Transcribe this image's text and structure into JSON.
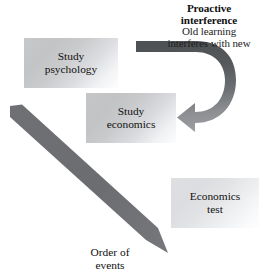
{
  "heading": {
    "title": "Proactive",
    "title2": "interference",
    "subtitle_line1": "Old learning",
    "subtitle_line2": "interferes with new"
  },
  "boxes": [
    {
      "id": "psychology",
      "label": "Study\npsychology",
      "line1": "Study",
      "line2": "psychology"
    },
    {
      "id": "economics",
      "label": "Study\neconomics",
      "line1": "Study",
      "line2": "economics"
    },
    {
      "id": "test",
      "label": "Economics\ntest",
      "line1": "Economics",
      "line2": "test"
    }
  ],
  "caption": {
    "line1": "Order of",
    "line2": "events"
  },
  "arrows": {
    "curved": {
      "name": "proactive-interference-arrow",
      "direction": "clockwise-hook-pointing-left",
      "color_start": "#54575a",
      "color_end": "#9b9c9e"
    },
    "timeline": {
      "name": "order-of-events-arrow",
      "direction": "down-right",
      "color_start": "#6b6d70",
      "color_end": "#74767a"
    }
  },
  "colors": {
    "background": "#ffffff",
    "text": "#101010",
    "box_gradient_start": "#c3c4c6",
    "box_gradient_end": "#fefefe",
    "arrow_dark": "#54575a",
    "arrow_light": "#9b9c9e"
  }
}
